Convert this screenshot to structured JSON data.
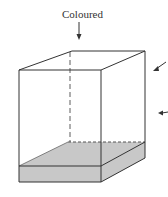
{
  "diagram": {
    "top_label": "Coloured",
    "colors": {
      "line": "#333333",
      "slab_fill": "#c8c8c8"
    }
  }
}
